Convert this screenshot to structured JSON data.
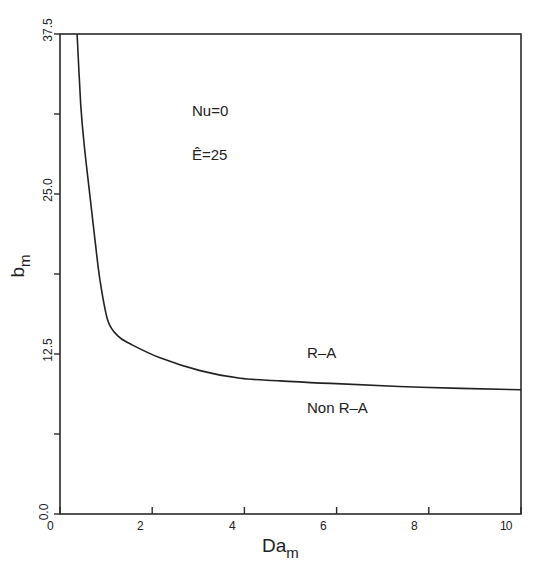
{
  "chart_data": {
    "type": "line",
    "title": "",
    "xlabel": "Da",
    "xlabel_sub": "m",
    "ylabel": "b",
    "ylabel_sub": "m",
    "xlim": [
      0,
      10
    ],
    "ylim": [
      0,
      37.5
    ],
    "x_ticks": [
      "0",
      "2",
      "4",
      "6",
      "8",
      "10"
    ],
    "x_tick_values": [
      0,
      2,
      4,
      6,
      8,
      10
    ],
    "y_ticks": [
      "0.0",
      "12.5",
      "25.0",
      "37.5"
    ],
    "y_tick_values": [
      0,
      12.5,
      25,
      37.5
    ],
    "y_minor_ticks": [
      6.25,
      18.75,
      31.25
    ],
    "grid": false,
    "legend": null,
    "series": [
      {
        "name": "neutral stability curve",
        "x": [
          0.37,
          0.45,
          0.52,
          0.61,
          0.76,
          0.87,
          1.04,
          1.26,
          1.52,
          2.17,
          3.04,
          3.91,
          4.78,
          5.87,
          7.83,
          10.0
        ],
        "y": [
          37.5,
          32.0,
          29.0,
          26.1,
          21.4,
          18.2,
          15.1,
          13.9,
          13.3,
          12.2,
          11.2,
          10.6,
          10.4,
          10.2,
          9.9,
          9.7
        ]
      }
    ],
    "annotations": [
      {
        "text": "Nu=0",
        "x": 3.0,
        "y": 31.0
      },
      {
        "text": "Ê=25",
        "x": 3.0,
        "y": 27.5
      },
      {
        "text": "R–A",
        "x": 5.4,
        "y": 12.3
      },
      {
        "text": "Non R–A",
        "x": 5.4,
        "y": 8.5
      }
    ]
  },
  "labels": {
    "nu": "Nu=0",
    "e": "Ê=25",
    "ra": "R–A",
    "nonra": "Non R–A",
    "xlabel": "Da",
    "xlabel_sub": "m",
    "ylabel": "b",
    "ylabel_sub": "m"
  },
  "ticks": {
    "x": [
      "0",
      "2",
      "4",
      "6",
      "8",
      "10"
    ],
    "y": [
      "0.0",
      "12.5",
      "25.0",
      "37.5"
    ]
  }
}
